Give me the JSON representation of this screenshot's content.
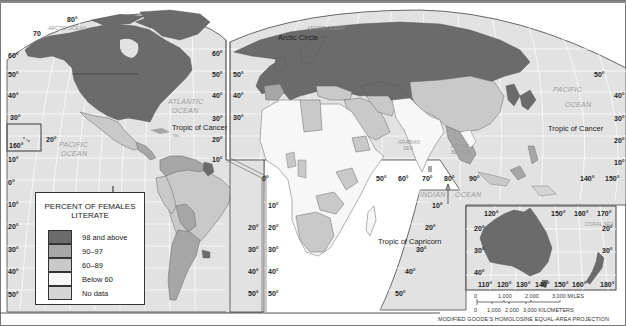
{
  "map": {
    "title": "Percent of Females Literate",
    "projection": "MODIFIED GOODE'S HOMOLOSINE EQUAL-AREA PROJECTION",
    "colors": {
      "frame": "#555555",
      "ocean": "#e2e2e2",
      "gridline": "#ffffff",
      "class_98_above": "#6b6b6b",
      "class_90_97": "#a6a6a6",
      "class_60_89": "#c9c9c9",
      "class_below_60": "#f7f7f7",
      "class_no_data": "#d4d4d4"
    }
  },
  "legend": {
    "title_line1": "PERCENT OF FEMALES",
    "title_line2": "LITERATE",
    "items": [
      {
        "label": "98 and above",
        "color": "#6b6b6b"
      },
      {
        "label": "90–97",
        "color": "#a6a6a6"
      },
      {
        "label": "60–89",
        "color": "#c9c9c9"
      },
      {
        "label": "Below 60",
        "color": "#f7f7f7"
      },
      {
        "label": "No data",
        "color": "#d4d4d4"
      }
    ]
  },
  "labels": {
    "oceans": {
      "arctic_west": "ARCTIC OCEAN",
      "arctic_east": "ARCTIC OCEAN",
      "atlantic_1": "ATLANTIC",
      "atlantic_2": "OCEAN",
      "pacific_west_1": "PACIFIC",
      "pacific_west_2": "OCEAN",
      "pacific_east_1": "PACIFIC",
      "pacific_east_2": "OCEAN",
      "indian_1": "INDIAN",
      "indian_2": "OCEAN",
      "arabian_1": "ARABIAN",
      "arabian_2": "SEA",
      "bengal_1": "BAY OF",
      "bengal_2": "BENGAL",
      "coral": "CORAL SEA"
    },
    "lines": {
      "arctic_circle": "Arctic Circle",
      "cancer_west": "Tropic of Cancer",
      "cancer_east": "Tropic of Cancer",
      "capricorn": "Tropic of Capricorn"
    },
    "lat_left": [
      "60°",
      "50°",
      "40°",
      "30°",
      "20°",
      "10°",
      "0°",
      "10°",
      "20°",
      "30°",
      "40°",
      "50°"
    ],
    "lat_americas_right": [
      "60°",
      "50°",
      "40°",
      "30°",
      "20°",
      "10°"
    ],
    "lat_sa_right": [
      "20°",
      "30°",
      "40°",
      "50°"
    ],
    "lat_africa_left": [
      "50°",
      "40°",
      "30°"
    ],
    "lat_africa_south": [
      "10°",
      "20°",
      "30°",
      "40°",
      "50°"
    ],
    "lat_indian": [
      "10°",
      "20°",
      "30°",
      "40°",
      "50°"
    ],
    "lat_pacific_east": [
      "50°",
      "40°",
      "30°",
      "20°",
      "10°"
    ],
    "top_lon_west": [
      "70",
      "80°"
    ],
    "hawaii_inset": {
      "lon": "160°",
      "lat": "20°"
    },
    "equator_lon": {
      "zero": "0°",
      "l50": "50°",
      "l60": "60°",
      "l70": "70°",
      "l80": "80°",
      "l90": "90°",
      "l140": "140°",
      "l150": "150°"
    },
    "australia_inset": {
      "top_lon": [
        "120°",
        "150°",
        "160°",
        "170°"
      ],
      "bottom_lon": [
        "110°",
        "120°",
        "130°",
        "140°",
        "150°",
        "160°",
        "180°"
      ],
      "lat_left": [
        "20°",
        "30°",
        "40°"
      ],
      "lat_right": [
        "20°",
        "30°"
      ]
    }
  },
  "scale_bar": {
    "miles": [
      "0",
      "1,000",
      "2,000",
      "3,000 MILES"
    ],
    "kilometers": [
      "0",
      "1,000",
      "2,000",
      "3,000 KILOMETERS"
    ]
  }
}
